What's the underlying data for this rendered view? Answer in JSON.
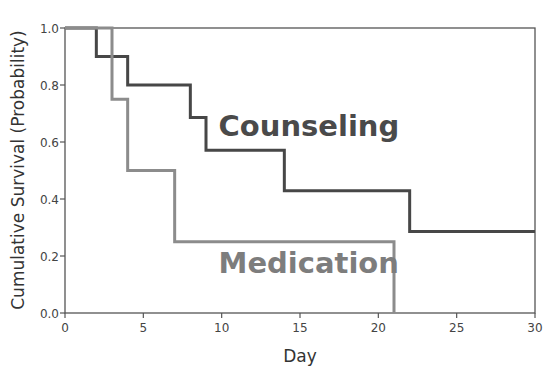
{
  "chart_data": {
    "type": "line",
    "subtype": "kaplan-meier-step",
    "title": "",
    "xlabel": "Day",
    "ylabel": "Cumulative Survival (Probability)",
    "xlim": [
      0,
      30
    ],
    "ylim": [
      0.0,
      1.0
    ],
    "x_ticks": [
      0,
      5,
      10,
      15,
      20,
      25,
      30
    ],
    "x_tick_labels": [
      "0",
      "5",
      "10",
      "15",
      "20",
      "25",
      "30"
    ],
    "y_ticks": [
      0.0,
      0.2,
      0.4,
      0.6,
      0.8,
      1.0
    ],
    "y_tick_labels": [
      "0.0",
      "0.2",
      "0.4",
      "0.6",
      "0.8",
      "1.0"
    ],
    "grid": false,
    "frame": "box",
    "legend": "inline-labels",
    "series": [
      {
        "name": "Counseling",
        "color": "#474747",
        "label_color": "#4a4a4a",
        "steps": [
          {
            "day": 0,
            "survival": 1.0
          },
          {
            "day": 2,
            "survival": 0.9
          },
          {
            "day": 4,
            "survival": 0.8
          },
          {
            "day": 8,
            "survival": 0.686
          },
          {
            "day": 9,
            "survival": 0.571
          },
          {
            "day": 14,
            "survival": 0.429
          },
          {
            "day": 22,
            "survival": 0.286
          }
        ],
        "end_day": 30,
        "label_position": {
          "day": 9.8,
          "survival": 0.62
        }
      },
      {
        "name": "Medication",
        "color": "#8c8c8c",
        "label_color": "#7d7d7d",
        "steps": [
          {
            "day": 0,
            "survival": 1.0
          },
          {
            "day": 3,
            "survival": 0.75
          },
          {
            "day": 4,
            "survival": 0.5
          },
          {
            "day": 7,
            "survival": 0.25
          },
          {
            "day": 21,
            "survival": 0.0
          }
        ],
        "end_day": 21,
        "label_position": {
          "day": 9.8,
          "survival": 0.14
        }
      }
    ]
  },
  "layout": {
    "plot_left": 65,
    "plot_right": 535,
    "plot_top": 28,
    "plot_bottom": 313,
    "axis_color": "#555555"
  }
}
